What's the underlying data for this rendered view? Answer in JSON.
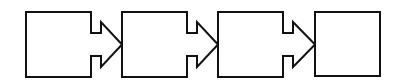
{
  "diagram": {
    "type": "process-flow",
    "stroke_color": "#111111",
    "fill_color": "#ffffff",
    "background": "#ffffff",
    "steps": [
      {
        "id": "step-1",
        "label": "",
        "shape": "box-with-right-arrow"
      },
      {
        "id": "step-2",
        "label": "",
        "shape": "box-with-right-arrow"
      },
      {
        "id": "step-3",
        "label": "",
        "shape": "box-with-right-arrow"
      },
      {
        "id": "step-4",
        "label": "",
        "shape": "box"
      }
    ],
    "connections": [
      {
        "from": "step-1",
        "to": "step-2"
      },
      {
        "from": "step-2",
        "to": "step-3"
      },
      {
        "from": "step-3",
        "to": "step-4"
      }
    ]
  }
}
